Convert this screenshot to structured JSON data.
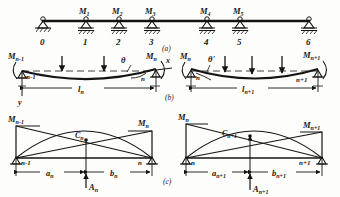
{
  "figure": {
    "ink_color": "#141414",
    "paper_color": "#fdfdfb",
    "panels": [
      {
        "key": "a",
        "label": "(a)"
      },
      {
        "key": "b",
        "label": "(b)"
      },
      {
        "key": "c",
        "label": "(c)"
      }
    ]
  },
  "panel_a": {
    "caption": "(a)",
    "supports": [
      "0",
      "1",
      "2",
      "3",
      "4",
      "5",
      "6"
    ],
    "moments": [
      "M₁",
      "M₂",
      "M₃",
      "M₄",
      "M₅"
    ],
    "moment_subscripts": [
      "1",
      "2",
      "3",
      "4",
      "5"
    ],
    "moment_symbol": "M"
  },
  "panel_b": {
    "caption": "(b)",
    "left_span": {
      "moment_left": "M",
      "moment_left_sub": "n-1",
      "moment_right": "M",
      "moment_right_sub": "n",
      "node_left": "n-1",
      "node_right": "n",
      "span": "l",
      "span_sub": "n",
      "angle": "θ",
      "axis_x": "x",
      "axis_y": "y"
    },
    "right_span": {
      "moment_left": "M",
      "moment_left_sub": "n",
      "moment_right": "M",
      "moment_right_sub": "n+1",
      "node_left": "n",
      "node_right": "n+1",
      "span": "l",
      "span_sub": "n+1",
      "angle": "θ'"
    }
  },
  "panel_c": {
    "caption": "(c)",
    "left_area": {
      "moment_left": "M",
      "moment_left_sub": "n-1",
      "moment_right": "M",
      "moment_right_sub": "n",
      "node_left": "n-1",
      "node_right": "n",
      "centroid": "C",
      "centroid_sub": "n",
      "dim_left": "a",
      "dim_left_sub": "n",
      "dim_right": "b",
      "dim_right_sub": "n",
      "area": "A",
      "area_sub": "n"
    },
    "right_area": {
      "moment_left": "M",
      "moment_left_sub": "n",
      "moment_right": "M",
      "moment_right_sub": "n+1",
      "node_left": "n",
      "node_right": "n+1",
      "centroid": "C",
      "centroid_sub": "n+1",
      "dim_left": "a",
      "dim_left_sub": "n+1",
      "dim_right": "b",
      "dim_right_sub": "n+1",
      "area": "A",
      "area_sub": "n+1"
    }
  }
}
